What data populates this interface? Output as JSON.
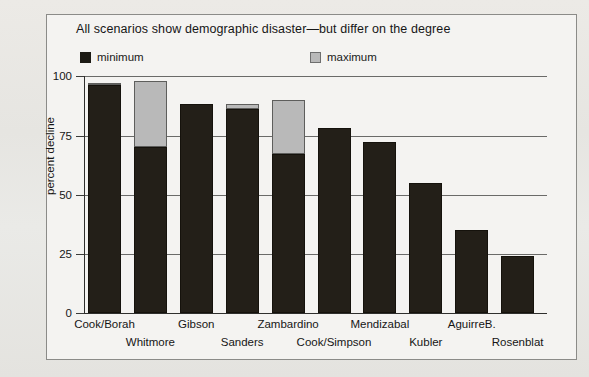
{
  "figure": {
    "title": "All scenarios show demographic disaster—but differ on the degree",
    "ylabel": "percent decline",
    "legend": {
      "min_label": "minimum",
      "max_label": "maximum",
      "min_color": "#231f18",
      "max_color": "#b9b9b9"
    }
  },
  "axis": {
    "yticks": [
      "0",
      "25",
      "50",
      "75",
      "100"
    ]
  },
  "chart_data": {
    "type": "bar",
    "title": "All scenarios show demographic disaster—but differ on the degree",
    "xlabel": "",
    "ylabel": "percent decline",
    "ylim": [
      0,
      100
    ],
    "yticks": [
      0,
      25,
      50,
      75,
      100
    ],
    "grid": true,
    "legend_position": "top",
    "stacked_range": true,
    "categories": [
      "Cook/Borah",
      "Whitmore",
      "Gibson",
      "Sanders",
      "Zambardino",
      "Cook/Simpson",
      "Mendizabal",
      "Kubler",
      "AguirreB.",
      "Rosenblat"
    ],
    "series": [
      {
        "name": "minimum",
        "color": "#231f18",
        "values": [
          96,
          70,
          88,
          86,
          67,
          78,
          72,
          55,
          35,
          24
        ]
      },
      {
        "name": "maximum",
        "color": "#b9b9b9",
        "values": [
          97,
          98,
          88,
          88,
          90,
          78,
          72,
          55,
          35,
          24
        ]
      }
    ]
  }
}
